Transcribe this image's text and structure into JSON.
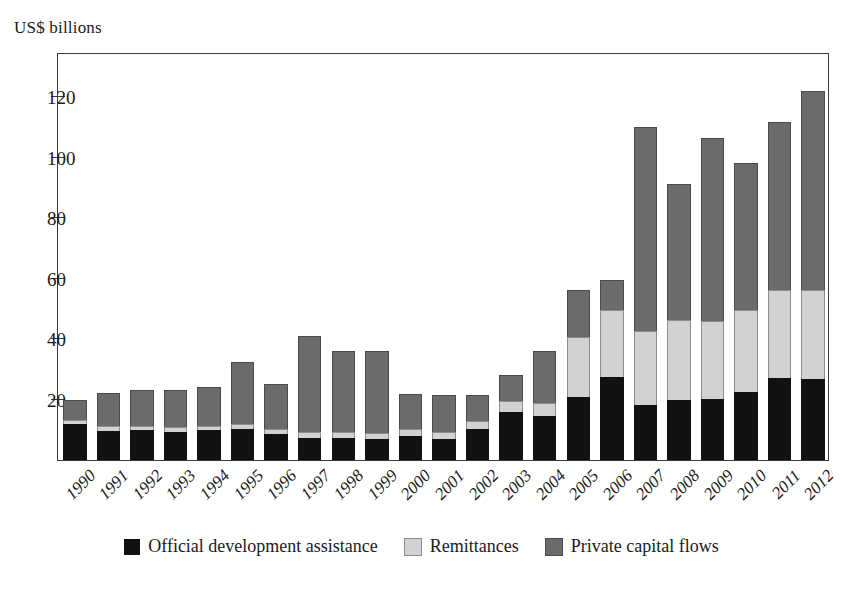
{
  "chart_data": {
    "type": "bar",
    "subtype": "stacked-vertical",
    "title": "",
    "ylabel": "US$ billions",
    "xlabel": "",
    "ylim": [
      0,
      135
    ],
    "yticks": [
      20,
      40,
      60,
      80,
      100,
      120
    ],
    "grid": false,
    "legend_position": "bottom-center",
    "categories": [
      "1990",
      "1991",
      "1992",
      "1993",
      "1994",
      "1995",
      "1996",
      "1997",
      "1998",
      "1999",
      "2000",
      "2001",
      "2002",
      "2003",
      "2004",
      "2005",
      "2006",
      "2007",
      "2008",
      "2009",
      "2010",
      "2011",
      "2012"
    ],
    "series": [
      {
        "name": "Official development assistance",
        "color": "#111111",
        "values": [
          11.8,
          9.6,
          9.8,
          9.4,
          9.8,
          10.2,
          8.6,
          7.4,
          7.2,
          7.0,
          8.0,
          6.8,
          10.4,
          15.8,
          14.6,
          20.8,
          27.4,
          18.2,
          20.0,
          20.2,
          22.4,
          27.2,
          26.8
        ]
      },
      {
        "name": "Remittances",
        "color": "#d2d2d2",
        "values": [
          1.4,
          1.6,
          1.6,
          1.6,
          1.6,
          1.6,
          1.8,
          1.8,
          2.0,
          2.0,
          2.4,
          2.6,
          2.4,
          3.6,
          4.2,
          20.0,
          22.4,
          24.6,
          26.4,
          25.8,
          27.4,
          29.0,
          29.4
        ]
      },
      {
        "name": "Private capital flows",
        "color": "#6b6b6b",
        "values": [
          6.6,
          11.0,
          11.8,
          12.2,
          12.8,
          20.6,
          14.6,
          32.0,
          27.0,
          27.2,
          11.6,
          12.2,
          8.8,
          8.6,
          17.2,
          15.4,
          9.8,
          67.4,
          44.8,
          60.4,
          48.6,
          55.8,
          66.0
        ]
      }
    ],
    "totals": [
      19.8,
      22.2,
      23.2,
      23.2,
      24.2,
      32.4,
      25.0,
      41.2,
      36.2,
      36.2,
      22.0,
      21.6,
      21.6,
      28.0,
      36.0,
      56.2,
      59.6,
      110.2,
      91.2,
      106.4,
      98.4,
      112.0,
      122.2
    ]
  },
  "legend": {
    "items": [
      {
        "label": "Official development assistance",
        "swatch": "oda"
      },
      {
        "label": "Remittances",
        "swatch": "rem"
      },
      {
        "label": "Private capital flows",
        "swatch": "pcf"
      }
    ]
  }
}
